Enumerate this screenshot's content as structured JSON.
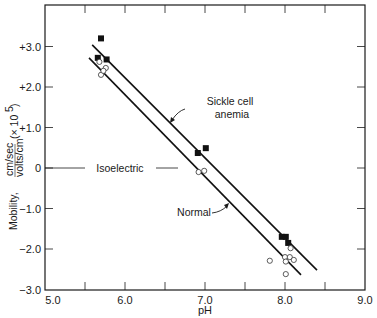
{
  "chart_data": {
    "type": "scatter",
    "title": "",
    "xlabel": "pH",
    "ylabel": "Mobility, cm/sec / volts/cm (× 10^5)",
    "ylabel_parts": {
      "main": "Mobility,",
      "frac_num": "cm/sec",
      "frac_den": "volts/cm",
      "scale": "(× 10",
      "scale_exp": "5",
      "scale_close": ")"
    },
    "xlim": [
      5.0,
      9.0
    ],
    "ylim": [
      -3.0,
      3.5
    ],
    "x_ticks": [
      5.0,
      6.0,
      7.0,
      8.0,
      9.0
    ],
    "x_tick_labels": [
      "5.0",
      "6.0",
      "7.0",
      "8.0",
      "9.0"
    ],
    "x_minor_ticks": [
      5.5,
      6.5,
      7.5,
      8.5
    ],
    "y_ticks": [
      3.0,
      2.0,
      1.0,
      0,
      -1.0,
      -2.0,
      -3.0
    ],
    "y_tick_labels": [
      "+3.0",
      "+2.0",
      "+1.0",
      "0",
      "−1.0",
      "−2.0",
      "−3.0"
    ],
    "grid": false,
    "series": [
      {
        "name": "Sickle cell anemia",
        "marker": "filled-square",
        "points": [
          [
            5.7,
            3.2
          ],
          [
            5.66,
            2.72
          ],
          [
            5.77,
            2.68
          ],
          [
            6.91,
            0.37
          ],
          [
            7.01,
            0.49
          ],
          [
            7.96,
            -1.7
          ],
          [
            8.01,
            -1.7
          ],
          [
            8.04,
            -1.85
          ]
        ],
        "fit_line": [
          [
            5.59,
            3.04
          ],
          [
            8.4,
            -2.52
          ]
        ]
      },
      {
        "name": "Normal",
        "marker": "open-circle",
        "points": [
          [
            5.68,
            2.62
          ],
          [
            5.76,
            2.47
          ],
          [
            5.7,
            2.3
          ],
          [
            5.73,
            2.4
          ],
          [
            6.92,
            -0.1
          ],
          [
            6.99,
            -0.07
          ],
          [
            8.07,
            -1.98
          ],
          [
            8.0,
            -2.2
          ],
          [
            8.06,
            -2.2
          ],
          [
            8.11,
            -2.27
          ],
          [
            8.01,
            -2.31
          ],
          [
            7.81,
            -2.29
          ],
          [
            8.01,
            -2.62
          ]
        ],
        "fit_line": [
          [
            5.55,
            2.72
          ],
          [
            8.2,
            -2.64
          ]
        ]
      }
    ],
    "annotations": [
      {
        "text_line1": "Sickle cell",
        "text_line2": "anemia",
        "points_to": "Sickle cell anemia line"
      },
      {
        "text": "Normal",
        "points_to": "Normal line"
      },
      {
        "text": "Isoelectric",
        "at_y": 0
      }
    ]
  }
}
